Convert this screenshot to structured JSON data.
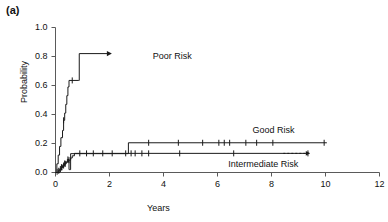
{
  "panel": {
    "label": "(a)"
  },
  "chart_data": {
    "type": "line",
    "subtype": "kaplan-meier-step",
    "title": "",
    "xlabel": "Years",
    "ylabel": "Probability",
    "xlim": [
      0,
      12
    ],
    "ylim": [
      0,
      1.0
    ],
    "xticks": [
      "0",
      "2",
      "4",
      "6",
      "8",
      "10",
      "12"
    ],
    "xtick_values": [
      0,
      2,
      4,
      6,
      8,
      10,
      12
    ],
    "yticks": [
      "0.0",
      "0.2",
      "0.4",
      "0.6",
      "0.8",
      "1.0"
    ],
    "ytick_values": [
      0.0,
      0.2,
      0.4,
      0.6,
      0.8,
      1.0
    ],
    "grid": false,
    "legend_position": "inline-annotations",
    "series": [
      {
        "name": "Poor Risk",
        "label": "Poor Risk",
        "color": "#1a1a1a",
        "label_x": 3.6,
        "label_y": 0.8,
        "arrow_end": true,
        "steps": [
          [
            0.0,
            0.0
          ],
          [
            0.05,
            0.06
          ],
          [
            0.1,
            0.12
          ],
          [
            0.15,
            0.18
          ],
          [
            0.2,
            0.24
          ],
          [
            0.26,
            0.29
          ],
          [
            0.3,
            0.36
          ],
          [
            0.34,
            0.41
          ],
          [
            0.38,
            0.47
          ],
          [
            0.42,
            0.53
          ],
          [
            0.46,
            0.59
          ],
          [
            0.5,
            0.635
          ],
          [
            0.86,
            0.635
          ],
          [
            0.88,
            0.82
          ],
          [
            2.05,
            0.82
          ]
        ],
        "censor_marks": [
          [
            0.3,
            0.36
          ],
          [
            0.62,
            0.635
          ]
        ]
      },
      {
        "name": "Good Risk",
        "label": "Good Risk",
        "color": "#1a1a1a",
        "label_x": 7.3,
        "label_y": 0.285,
        "steps": [
          [
            0.0,
            0.0
          ],
          [
            0.16,
            0.018
          ],
          [
            0.22,
            0.036
          ],
          [
            0.3,
            0.054
          ],
          [
            0.36,
            0.072
          ],
          [
            0.44,
            0.09
          ],
          [
            0.5,
            0.02
          ],
          [
            0.52,
            0.02
          ],
          [
            0.56,
            0.13
          ],
          [
            2.65,
            0.13
          ],
          [
            2.7,
            0.205
          ],
          [
            10.05,
            0.205
          ]
        ],
        "censor_marks": [
          [
            0.22,
            0.036
          ],
          [
            0.34,
            0.062
          ],
          [
            0.46,
            0.09
          ],
          [
            3.45,
            0.205
          ],
          [
            4.55,
            0.205
          ],
          [
            5.45,
            0.205
          ],
          [
            6.05,
            0.205
          ],
          [
            6.25,
            0.205
          ],
          [
            6.45,
            0.205
          ],
          [
            7.05,
            0.205
          ],
          [
            7.45,
            0.205
          ],
          [
            8.05,
            0.205
          ],
          [
            9.95,
            0.205
          ]
        ]
      },
      {
        "name": "Intermediate Risk",
        "label": "Intermediate Risk",
        "color": "#1a1a1a",
        "label_x": 6.4,
        "label_y": 0.055,
        "steps": [
          [
            0.0,
            0.0
          ],
          [
            0.1,
            0.012
          ],
          [
            0.14,
            0.024
          ],
          [
            0.2,
            0.036
          ],
          [
            0.26,
            0.048
          ],
          [
            0.32,
            0.06
          ],
          [
            0.4,
            0.072
          ],
          [
            0.48,
            0.085
          ],
          [
            0.56,
            0.1
          ],
          [
            0.62,
            0.115
          ],
          [
            0.7,
            0.132
          ],
          [
            9.4,
            0.132
          ]
        ],
        "censor_marks": [
          [
            0.06,
            0.005
          ],
          [
            0.12,
            0.012
          ],
          [
            0.18,
            0.024
          ],
          [
            0.24,
            0.036
          ],
          [
            0.3,
            0.048
          ],
          [
            0.36,
            0.06
          ],
          [
            0.5,
            0.085
          ],
          [
            0.9,
            0.132
          ],
          [
            1.15,
            0.132
          ],
          [
            1.4,
            0.132
          ],
          [
            1.75,
            0.132
          ],
          [
            2.1,
            0.132
          ],
          [
            2.6,
            0.132
          ],
          [
            2.8,
            0.132
          ],
          [
            2.95,
            0.132
          ],
          [
            3.2,
            0.132
          ],
          [
            3.45,
            0.132
          ],
          [
            4.6,
            0.132
          ],
          [
            6.6,
            0.132
          ],
          [
            9.35,
            0.132
          ]
        ]
      }
    ]
  }
}
